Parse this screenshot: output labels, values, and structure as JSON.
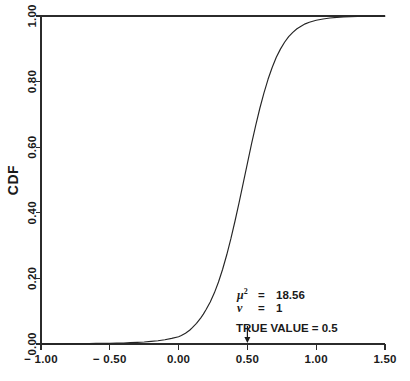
{
  "chart_data": {
    "type": "line",
    "title": "",
    "subtitle": "",
    "xlabel": "",
    "ylabel": "CDF",
    "xlim": [
      -1.0,
      1.5
    ],
    "ylim": [
      0.0,
      1.0
    ],
    "grid": false,
    "legend": null,
    "x_ticks": [
      -1.0,
      -0.5,
      0.0,
      0.5,
      1.0,
      1.5
    ],
    "x_tick_labels": [
      "-1.00",
      "-0.50",
      "0.00",
      "0.50",
      "1.00",
      "1.50"
    ],
    "y_ticks": [
      0.0,
      0.2,
      0.4,
      0.6,
      0.8,
      1.0
    ],
    "y_tick_labels": [
      "0.00",
      "0.20",
      "0.40",
      "0.60",
      "0.80",
      "1.00"
    ],
    "series": [
      {
        "name": "CDF",
        "x": [
          -1.0,
          -0.95,
          -0.9,
          -0.85,
          -0.8,
          -0.75,
          -0.7,
          -0.65,
          -0.6,
          -0.55,
          -0.5,
          -0.45,
          -0.4,
          -0.35,
          -0.3,
          -0.25,
          -0.2,
          -0.15,
          -0.1,
          -0.05,
          0.0,
          0.02,
          0.05,
          0.08,
          0.1,
          0.13,
          0.16,
          0.18,
          0.2,
          0.23,
          0.26,
          0.29,
          0.32,
          0.35,
          0.38,
          0.41,
          0.44,
          0.47,
          0.5,
          0.53,
          0.56,
          0.59,
          0.62,
          0.65,
          0.68,
          0.71,
          0.74,
          0.77,
          0.8,
          0.83,
          0.86,
          0.89,
          0.92,
          0.95,
          1.0,
          1.05,
          1.1,
          1.15,
          1.2,
          1.3,
          1.4,
          1.5
        ],
        "y": [
          0.0,
          0.0,
          0.0,
          0.0,
          0.001,
          0.001,
          0.001,
          0.001,
          0.002,
          0.002,
          0.002,
          0.003,
          0.003,
          0.004,
          0.005,
          0.006,
          0.008,
          0.01,
          0.013,
          0.017,
          0.022,
          0.026,
          0.033,
          0.042,
          0.05,
          0.063,
          0.079,
          0.091,
          0.105,
          0.128,
          0.156,
          0.189,
          0.228,
          0.272,
          0.321,
          0.375,
          0.432,
          0.491,
          0.551,
          0.61,
          0.666,
          0.718,
          0.765,
          0.807,
          0.843,
          0.874,
          0.899,
          0.92,
          0.937,
          0.95,
          0.961,
          0.969,
          0.976,
          0.981,
          0.987,
          0.991,
          0.994,
          0.996,
          0.997,
          0.999,
          0.999,
          1.0
        ]
      }
    ],
    "annotations": [
      {
        "id": "mu-squared",
        "symbol": "μ",
        "superscript": "2",
        "equals": "=",
        "value": "18.56"
      },
      {
        "id": "nu",
        "symbol": "ν",
        "superscript": "",
        "equals": "=",
        "value": "1"
      },
      {
        "id": "true-value",
        "text": "TRUE VALUE  =  0.5",
        "marker_x": 0.5
      }
    ]
  },
  "colors": {
    "background": "#ffffff",
    "axis": "#2b2b2b",
    "curve": "#252525",
    "text": "#1a1a1a"
  }
}
